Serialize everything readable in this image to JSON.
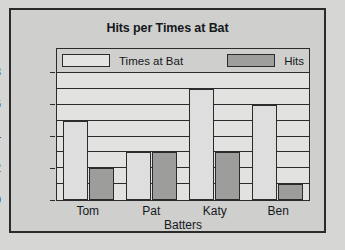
{
  "chart_data": {
    "type": "bar",
    "title": "Hits per Times at Bat",
    "xlabel": "Batters",
    "ylabel": "",
    "categories": [
      "Tom",
      "Pat",
      "Katy",
      "Ben"
    ],
    "series": [
      {
        "name": "Times at Bat",
        "values": [
          5,
          3,
          7,
          6
        ],
        "color": "#dedede"
      },
      {
        "name": "Hits",
        "values": [
          2,
          3,
          3,
          1
        ],
        "color": "#9d9d9b"
      }
    ],
    "ylim": [
      0,
      8
    ],
    "ytick_labels": [
      "0",
      "2",
      "4",
      "6",
      "8"
    ],
    "ytick_values": [
      0,
      2,
      4,
      6,
      8
    ],
    "gridlines": [
      1,
      2,
      3,
      4,
      5,
      6,
      7,
      8
    ],
    "grid": true,
    "legend_position": "top-inside"
  },
  "figure": {
    "background": "#cfcfcd",
    "border_color": "#2b2b2b",
    "plot_background": "#e2e2e0"
  }
}
